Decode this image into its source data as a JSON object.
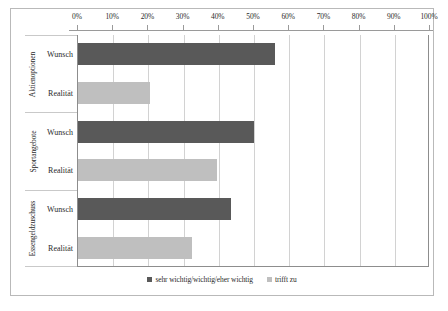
{
  "chart_data": {
    "type": "bar",
    "orientation": "horizontal",
    "title": "",
    "xlabel": "",
    "ylabel": "",
    "xlim": [
      0,
      100
    ],
    "xticks": [
      "0%",
      "10%",
      "20%",
      "30%",
      "40%",
      "50%",
      "60%",
      "70%",
      "80%",
      "90%",
      "100%"
    ],
    "xtick_values": [
      0,
      10,
      20,
      30,
      40,
      50,
      60,
      70,
      80,
      90,
      100
    ],
    "grid": true,
    "legend_position": "bottom-center",
    "categories": [
      "Aktienoptionen",
      "Sportangebote",
      "Essengeldzuschuss"
    ],
    "subcategories": [
      "Wunsch",
      "Realität"
    ],
    "series": [
      {
        "name": "sehr wichtig/wichtig/eher wichtig",
        "subcategory": "Wunsch",
        "color": "#595959",
        "values": [
          56,
          50,
          43.5
        ]
      },
      {
        "name": "trifft zu",
        "subcategory": "Realität",
        "color": "#bfbfbf",
        "values": [
          20.5,
          39.5,
          32.5
        ]
      }
    ],
    "groups": [
      {
        "label": "Aktienoptionen",
        "bars": [
          {
            "label": "Wunsch",
            "value": 56,
            "series": "sehr wichtig/wichtig/eher wichtig",
            "color": "#595959"
          },
          {
            "label": "Realität",
            "value": 20.5,
            "series": "trifft zu",
            "color": "#bfbfbf"
          }
        ]
      },
      {
        "label": "Sportangebote",
        "bars": [
          {
            "label": "Wunsch",
            "value": 50,
            "series": "sehr wichtig/wichtig/eher wichtig",
            "color": "#595959"
          },
          {
            "label": "Realität",
            "value": 39.5,
            "series": "trifft zu",
            "color": "#bfbfbf"
          }
        ]
      },
      {
        "label": "Essengeldzuschuss",
        "bars": [
          {
            "label": "Wunsch",
            "value": 43.5,
            "series": "sehr wichtig/wichtig/eher wichtig",
            "color": "#595959"
          },
          {
            "label": "Realität",
            "value": 32.5,
            "series": "trifft zu",
            "color": "#bfbfbf"
          }
        ]
      }
    ],
    "legend": [
      {
        "label": "sehr wichtig/wichtig/eher wichtig",
        "color": "#595959"
      },
      {
        "label": "trifft zu",
        "color": "#bfbfbf"
      }
    ]
  },
  "style": {
    "plot_border_color": "#8d8d8d",
    "gridline_color": "#d2d2d2",
    "frame_color": "#b9b9b9",
    "text_color": "#2b2b2b",
    "background": "#ffffff"
  }
}
